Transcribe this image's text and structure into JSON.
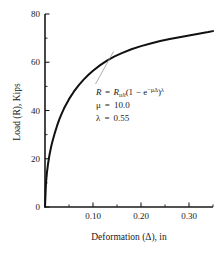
{
  "chart_data": {
    "type": "line",
    "title": "",
    "xlabel": "Deformation (Δ), in",
    "ylabel": "Load (R), Kips",
    "xlim": [
      0,
      0.35
    ],
    "ylim": [
      0,
      80
    ],
    "grid": false,
    "legend": null,
    "x_ticks": [
      0.1,
      0.2,
      0.3
    ],
    "x_tick_labels": [
      "0.10",
      "0.20",
      "0.30"
    ],
    "x_minor_ticks": [
      0.05,
      0.15,
      0.25,
      0.35
    ],
    "y_ticks": [
      0,
      20,
      40,
      60,
      80
    ],
    "y_tick_labels": [
      "0",
      "20",
      "40",
      "60",
      "80"
    ],
    "y_minor_ticks": [
      10,
      30,
      50,
      70
    ],
    "series": [
      {
        "name": "Load-deformation curve",
        "color": "#111111",
        "x": [
          0.0,
          0.002,
          0.004,
          0.006,
          0.008,
          0.01,
          0.013,
          0.016,
          0.02,
          0.025,
          0.03,
          0.035,
          0.04,
          0.05,
          0.06,
          0.07,
          0.08,
          0.09,
          0.1,
          0.115,
          0.13,
          0.145,
          0.16,
          0.18,
          0.2,
          0.22,
          0.24,
          0.26,
          0.28,
          0.3,
          0.32,
          0.34,
          0.35
        ],
        "y": [
          0.0,
          9.8,
          14.2,
          17.4,
          20.0,
          22.3,
          25.2,
          27.6,
          30.4,
          33.6,
          36.4,
          38.8,
          41.0,
          44.7,
          47.8,
          50.4,
          52.7,
          54.7,
          56.5,
          58.8,
          60.8,
          62.4,
          63.8,
          65.4,
          66.7,
          67.8,
          68.8,
          69.6,
          70.4,
          71.1,
          71.8,
          72.5,
          72.9
        ]
      }
    ],
    "annotation": {
      "equation_parts": {
        "r": "R",
        "equals": "=",
        "r_ult_base": "R",
        "r_ult_sub": "ult",
        "open_paren": "(1",
        "minus": "−",
        "e_base": "e",
        "e_exp": "−μΔ",
        "close_paren": ")",
        "lambda_exp": "λ"
      },
      "equation_plain": "R = R_ult(1 − e^(−μΔ))^λ",
      "params": [
        {
          "symbol": "μ",
          "equals": "=",
          "value": "10.0"
        },
        {
          "symbol": "λ",
          "equals": "=",
          "value": "0.55"
        }
      ],
      "leader_color": "#8a8a8a"
    },
    "axis_color": "#1a1a1a"
  }
}
